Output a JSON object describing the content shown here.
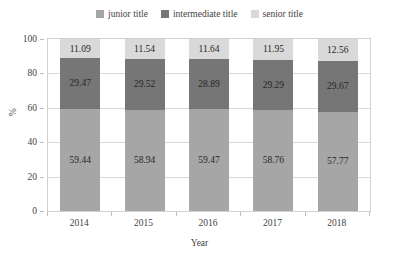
{
  "chart_data": {
    "type": "bar",
    "subtype": "stacked-bar-100",
    "title": "",
    "xlabel": "Year",
    "ylabel": "%",
    "categories": [
      "2014",
      "2015",
      "2016",
      "2017",
      "2018"
    ],
    "series": [
      {
        "name": "junior title",
        "color": "#a6a6a6",
        "values": [
          59.44,
          58.94,
          59.47,
          58.76,
          57.77
        ]
      },
      {
        "name": "intermediate title",
        "color": "#767676",
        "values": [
          29.47,
          29.52,
          28.89,
          29.29,
          29.67
        ]
      },
      {
        "name": "senior title",
        "color": "#d9d9d9",
        "values": [
          11.09,
          11.54,
          11.64,
          11.95,
          12.56
        ]
      }
    ],
    "ylim": [
      0,
      100
    ],
    "yticks": [
      0,
      20,
      40,
      60,
      80,
      100
    ],
    "ytick_labels": [
      "0",
      "20",
      "40",
      "60",
      "80",
      "100"
    ],
    "grid": "horizontal",
    "legend_position": "top-center",
    "data_labels": true,
    "stack_order_bottom_to_top": [
      "junior title",
      "intermediate title",
      "senior title"
    ]
  },
  "legend": {
    "items": [
      {
        "label": "junior title",
        "color": "#a6a6a6"
      },
      {
        "label": "intermediate title",
        "color": "#767676"
      },
      {
        "label": "senior title",
        "color": "#d9d9d9"
      }
    ]
  },
  "axes": {
    "y_title": "%",
    "x_title": "Year",
    "y_ticks": [
      "0",
      "20",
      "40",
      "60",
      "80",
      "100"
    ],
    "x_ticks": [
      "2014",
      "2015",
      "2016",
      "2017",
      "2018"
    ]
  },
  "bar_labels": {
    "senior": [
      "11.09",
      "11.54",
      "11.64",
      "11.95",
      "12.56"
    ],
    "intermediate": [
      "29.47",
      "29.52",
      "28.89",
      "29.29",
      "29.67"
    ],
    "junior": [
      "59.44",
      "58.94",
      "59.47",
      "58.76",
      "57.77"
    ]
  }
}
